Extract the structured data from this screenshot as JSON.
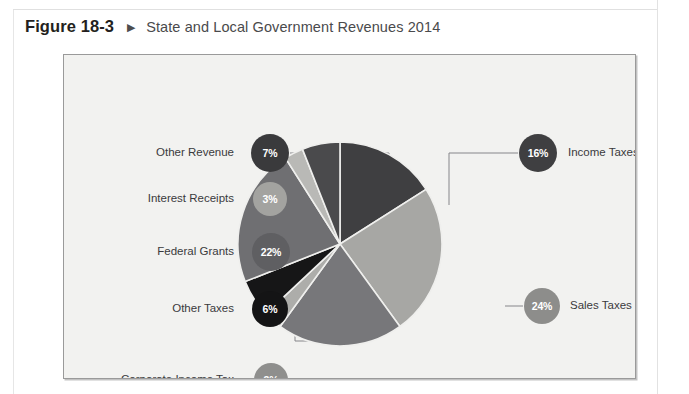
{
  "figure": {
    "number": "Figure 18-3",
    "arrow": "▶",
    "title": "State and Local Government Revenues 2014"
  },
  "chart_data": {
    "type": "pie",
    "title": "State and Local Government Revenues 2014",
    "unit": "percent",
    "legend_position": "callout-labels",
    "categories": [
      "Income Taxes",
      "Sales Taxes",
      "Property Taxes",
      "Corporate Income Tax",
      "Other Taxes",
      "Federal Grants",
      "Interest Receipts",
      "Other Revenue"
    ],
    "values": [
      16,
      24,
      20,
      3,
      6,
      22,
      3,
      7
    ],
    "slices": [
      {
        "label": "Income Taxes",
        "value": 16,
        "display": "16%",
        "color": "#3f3f41",
        "badge_color": "#3f3f41",
        "start": 0,
        "sweep": 57.6
      },
      {
        "label": "Sales Taxes",
        "value": 24,
        "display": "24%",
        "color": "#a7a7a4",
        "badge_color": "#8d8d8b",
        "start": 57.6,
        "sweep": 86.4
      },
      {
        "label": "Property Taxes",
        "value": 20,
        "display": "20%",
        "color": "#77777a",
        "badge_color": "#6e6e71",
        "start": 144,
        "sweep": 72
      },
      {
        "label": "Corporate Income Tax",
        "value": 3,
        "display": "3%",
        "color": "#adadaa",
        "badge_color": "#8f8f8d",
        "start": 216,
        "sweep": 10.8
      },
      {
        "label": "Other Taxes",
        "value": 6,
        "display": "6%",
        "color": "#161617",
        "badge_color": "#141415",
        "start": 226.8,
        "sweep": 21.6
      },
      {
        "label": "Federal Grants",
        "value": 22,
        "display": "22%",
        "color": "#6f6f72",
        "badge_color": "#5f5f62",
        "start": 248.4,
        "sweep": 79.2
      },
      {
        "label": "Interest Receipts",
        "value": 3,
        "display": "3%",
        "color": "#b9b9b6",
        "badge_color": "#a3a3a0",
        "start": 327.6,
        "sweep": 10.8
      },
      {
        "label": "Other Revenue",
        "value": 7,
        "display": "7%",
        "color": "#4a4a4c",
        "badge_color": "#3a3a3c",
        "start": 338.4,
        "sweep": 21.6
      }
    ],
    "callouts": [
      {
        "label": "Other Revenue",
        "display": "7%",
        "side": "left",
        "badge_cx": 206,
        "badge_cy": 98,
        "badge_r": 19,
        "text_x": 170,
        "text_y": 98,
        "elbow_x": 325,
        "target_x": 325,
        "target_y": 150,
        "color": "#3a3a3c"
      },
      {
        "label": "Interest Receipts",
        "display": "3%",
        "side": "left",
        "badge_cx": 206,
        "badge_cy": 144,
        "badge_r": 17,
        "text_x": 170,
        "text_y": 144,
        "elbow_x": 300,
        "target_x": 300,
        "target_y": 176,
        "color": "#a3a3a0"
      },
      {
        "label": "Federal Grants",
        "display": "22%",
        "side": "left",
        "badge_cx": 207,
        "badge_cy": 197,
        "badge_r": 19,
        "text_x": 170,
        "text_y": 197,
        "elbow_x": 240,
        "target_x": 240,
        "target_y": 218,
        "color": "#5f5f62"
      },
      {
        "label": "Other Taxes",
        "display": "6%",
        "side": "left",
        "badge_cx": 206,
        "badge_cy": 254,
        "badge_r": 18,
        "text_x": 170,
        "text_y": 254,
        "elbow_x": 231,
        "target_x": 267,
        "target_y": 286,
        "color": "#141415"
      },
      {
        "label": "Corporate Income Tax",
        "display": "3%",
        "side": "left",
        "badge_cx": 207,
        "badge_cy": 325,
        "badge_r": 17,
        "text_x": 170,
        "text_y": 325,
        "elbow_x": 300,
        "target_x": 300,
        "target_y": 325,
        "color": "#8f8f8d"
      },
      {
        "label": "Income Taxes",
        "display": "16%",
        "side": "right",
        "badge_cx": 474,
        "badge_cy": 98,
        "badge_r": 19,
        "text_x": 504,
        "text_y": 98,
        "elbow_x": 385,
        "target_x": 385,
        "target_y": 150,
        "color": "#3f3f41"
      },
      {
        "label": "Sales Taxes",
        "display": "24%",
        "side": "right",
        "badge_cx": 478,
        "badge_cy": 251,
        "badge_r": 18,
        "text_x": 506,
        "text_y": 251,
        "elbow_x": 441,
        "target_x": 441,
        "target_y": 251,
        "color": "#8d8d8b"
      },
      {
        "label": "Property Taxes",
        "display": "20%",
        "side": "right",
        "badge_cx": 453,
        "badge_cy": 353,
        "badge_r": 19,
        "text_x": 482,
        "text_y": 353,
        "elbow_x": 362,
        "target_x": 362,
        "target_y": 330,
        "color": "#6e6e71"
      }
    ],
    "geometry": {
      "cx": 276,
      "cy": 189,
      "r": 102
    }
  },
  "bleed_lines": [
    "the effects of government spending and taxation on",
    "total output, employment, and the price level. Fiscal",
    "policy is the use of government spending and",
    "taxation to influence the economy. Government",
    "revenues at the state and local level come from",
    "a broad set of sources, as shown in the figure.",
    "Sales taxes and property taxes together",
    "account for nearly half of all revenues."
  ]
}
